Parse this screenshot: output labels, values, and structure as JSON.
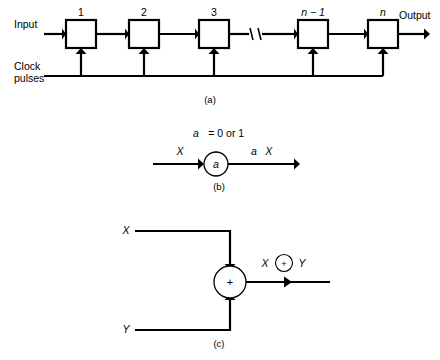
{
  "figure": {
    "panels": [
      {
        "id": "a",
        "caption": "(a)",
        "name": "shift-register-chain",
        "input_label": "Input",
        "output_label": "Output",
        "clock_label_line1": "Clock",
        "clock_label_line2": "pulses",
        "stage_labels": [
          "1",
          "2",
          "3",
          "n − 1",
          "n"
        ],
        "break_symbol": "//"
      },
      {
        "id": "b",
        "caption": "(b)",
        "name": "scalar-multiplier",
        "condition_var": "a",
        "condition_rest": "= 0 or 1",
        "input_label": "X",
        "node_label": "a",
        "output_label_coef": "a",
        "output_label_var": "X"
      },
      {
        "id": "c",
        "caption": "(c)",
        "name": "modulo-two-adder",
        "input_top_label": "X",
        "input_bottom_label": "Y",
        "node_symbol": "+",
        "output_left": "X",
        "output_op": "+",
        "output_right": "Y"
      }
    ]
  },
  "colors": {
    "ink": "#000000",
    "paper": "#ffffff"
  }
}
